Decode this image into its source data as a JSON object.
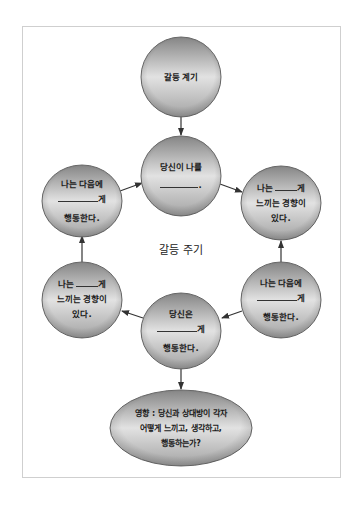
{
  "diagram": {
    "title": "갈등 주기",
    "colors": {
      "node_top": "#8a8a8a",
      "node_mid": "#e4e4e4",
      "node_bottom": "#9c9c9c",
      "node_border": "#6a6a6a",
      "arrow": "#333333",
      "frame": "#cfcfcf"
    },
    "nodes": {
      "trigger": {
        "line1": "갈등 계기"
      },
      "center": {
        "line1": "당신이 나를",
        "line2": "________."
      },
      "left_upper": {
        "line1": "나는 다음에",
        "line2_suffix": "게",
        "line3": "행동한다."
      },
      "right_upper": {
        "line1_prefix": "나는",
        "line1_suffix": "게",
        "line2": "느끼는 경향이",
        "line3": "있다."
      },
      "left_lower": {
        "line1_prefix": "나는",
        "line1_suffix": "게",
        "line2": "느끼는 경향이",
        "line3": "있다."
      },
      "right_lower": {
        "line1": "나는 다음에",
        "line2_suffix": "게",
        "line3": "행동한다."
      },
      "bottom_center": {
        "line1": "당신은",
        "line2_suffix": "게",
        "line3": "행동한다."
      },
      "impact": {
        "line1": "영향 : 당신과 상대방이 각자",
        "line2": "어떻게 느끼고, 생각하고,",
        "line3": "행동하는가?"
      }
    },
    "edges": [
      {
        "from": "trigger",
        "to": "center"
      },
      {
        "from": "left_upper",
        "to": "center"
      },
      {
        "from": "center",
        "to": "right_upper"
      },
      {
        "from": "right_lower",
        "to": "right_upper"
      },
      {
        "from": "right_lower",
        "to": "bottom_center"
      },
      {
        "from": "bottom_center",
        "to": "left_lower"
      },
      {
        "from": "left_lower",
        "to": "left_upper"
      },
      {
        "from": "bottom_center",
        "to": "impact"
      }
    ]
  }
}
